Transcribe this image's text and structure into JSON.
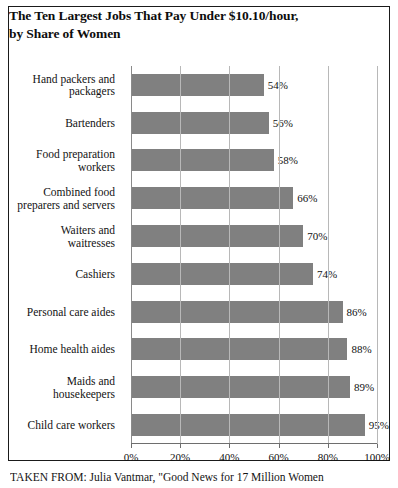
{
  "figure": {
    "title_lines": [
      "The Ten Largest Jobs That Pay Under $10.10/hour,",
      "by Share of Women"
    ],
    "caption": "TAKEN FROM: Julia Vantmar, \"Good News for 17 Million Women"
  },
  "chart_data": {
    "type": "bar",
    "orientation": "horizontal",
    "title": "The Ten Largest Jobs That Pay Under $10.10/hour, by Share of Women",
    "xlabel": "",
    "ylabel": "",
    "xlim": [
      0,
      100
    ],
    "grid": true,
    "legend": "none",
    "series_color": "#808080",
    "categories": [
      "Hand packers and packagers",
      "Bartenders",
      "Food preparation workers",
      "Combined food preparers and servers",
      "Waiters and waitresses",
      "Cashiers",
      "Personal care aides",
      "Home health aides",
      "Maids and housekeepers",
      "Child care workers"
    ],
    "category_lines": [
      [
        "Hand packers and",
        "packagers"
      ],
      [
        "Bartenders"
      ],
      [
        "Food preparation",
        "workers"
      ],
      [
        "Combined food",
        "preparers and servers"
      ],
      [
        "Waiters and",
        "waitresses"
      ],
      [
        "Cashiers"
      ],
      [
        "Personal care aides"
      ],
      [
        "Home health aides"
      ],
      [
        "Maids and",
        "housekeepers"
      ],
      [
        "Child care workers"
      ]
    ],
    "values": [
      54,
      56,
      58,
      66,
      70,
      74,
      86,
      88,
      89,
      95
    ],
    "value_labels": [
      "54%",
      "56%",
      "58%",
      "66%",
      "70%",
      "74%",
      "86%",
      "88%",
      "89%",
      "95%"
    ],
    "xticks": [
      0,
      20,
      40,
      60,
      80,
      100
    ],
    "xtick_labels": [
      "0%",
      "20%",
      "40%",
      "60%",
      "80%",
      "100%"
    ]
  }
}
